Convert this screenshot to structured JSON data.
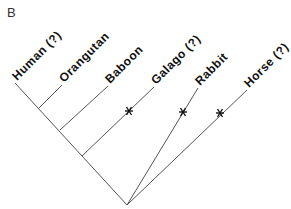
{
  "figure": {
    "panel_label": "B",
    "tree_type": "cladogram",
    "root": {
      "x": 127,
      "y": 205
    },
    "taxa": [
      {
        "id": "human",
        "label": "Human (?)",
        "tip": {
          "x": 15,
          "y": 83
        },
        "attach": {
          "x": 15,
          "y": 83
        },
        "marked": false
      },
      {
        "id": "orangutan",
        "label": "Orangutan",
        "tip": {
          "x": 62,
          "y": 85
        },
        "attach": {
          "x": 39,
          "y": 108
        },
        "marked": false
      },
      {
        "id": "baboon",
        "label": "Baboon",
        "tip": {
          "x": 108,
          "y": 86
        },
        "attach": {
          "x": 60,
          "y": 130
        },
        "marked": false
      },
      {
        "id": "galago",
        "label": "Galago (?)",
        "tip": {
          "x": 154,
          "y": 87
        },
        "attach": {
          "x": 82,
          "y": 156
        },
        "marked": true,
        "mark": {
          "x": 129,
          "y": 111
        }
      },
      {
        "id": "rabbit",
        "label": "Rabbit",
        "tip": {
          "x": 198,
          "y": 88
        },
        "attach": {
          "x": 127,
          "y": 205
        },
        "marked": true,
        "mark": {
          "x": 183,
          "y": 112
        }
      },
      {
        "id": "horse",
        "label": "Horse (?)",
        "tip": {
          "x": 247,
          "y": 90
        },
        "attach": {
          "x": 127,
          "y": 205
        },
        "marked": true,
        "mark": {
          "x": 220,
          "y": 113
        }
      }
    ],
    "mark_symbol": "asterisk",
    "colors": {
      "branch": "#555555",
      "text": "#111111",
      "background": "#ffffff"
    }
  }
}
